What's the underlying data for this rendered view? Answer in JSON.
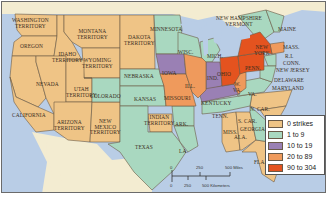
{
  "map": {
    "title": "Strikes by state",
    "colors": {
      "ocean": "#b9cde6",
      "mexico_canada": "#f3ecd1",
      "border": "#6b6b6b"
    },
    "legend": {
      "items": [
        {
          "label": "0 strikes",
          "color": "#efc486"
        },
        {
          "label": "1 to 9",
          "color": "#a9d8c0"
        },
        {
          "label": "10 to 19",
          "color": "#9a80b4"
        },
        {
          "label": "20 to 89",
          "color": "#ef9a5c"
        },
        {
          "label": "90 to 304",
          "color": "#e4531f"
        }
      ]
    },
    "scale": {
      "miles_ticks": [
        "0",
        "250",
        "500 Miles"
      ],
      "km_ticks": [
        "0",
        "250",
        "500 Kilometers"
      ]
    },
    "regions": [
      {
        "label": "WASHINGTON\nTERRITORY",
        "category": "0 strikes"
      },
      {
        "label": "OREGON",
        "category": "0 strikes"
      },
      {
        "label": "IDAHO\nTERRITORY",
        "category": "0 strikes"
      },
      {
        "label": "MONTANA\nTERRITORY",
        "category": "0 strikes"
      },
      {
        "label": "WYOMING\nTERRITORY",
        "category": "0 strikes"
      },
      {
        "label": "DAKOTA\nTERRITORY",
        "category": "0 strikes"
      },
      {
        "label": "NEVADA",
        "category": "0 strikes"
      },
      {
        "label": "UTAH\nTERRITORY",
        "category": "0 strikes"
      },
      {
        "label": "CALIFORNIA",
        "category": "0 strikes"
      },
      {
        "label": "ARIZONA\nTERRITORY",
        "category": "0 strikes"
      },
      {
        "label": "NEW\nMEXICO\nTERRITORY",
        "category": "0 strikes"
      },
      {
        "label": "COLORADO",
        "category": "1 to 9"
      },
      {
        "label": "NEBRASKA",
        "category": "1 to 9"
      },
      {
        "label": "KANSAS",
        "category": "1 to 9"
      },
      {
        "label": "INDIAN\nTERRITORY",
        "category": "0 strikes"
      },
      {
        "label": "TEXAS",
        "category": "1 to 9"
      },
      {
        "label": "MINNESOTA",
        "category": "1 to 9"
      },
      {
        "label": "IOWA",
        "category": "10 to 19"
      },
      {
        "label": "MISSOURI",
        "category": "20 to 89"
      },
      {
        "label": "ARK.",
        "category": "1 to 9"
      },
      {
        "label": "LA.",
        "category": "1 to 9"
      },
      {
        "label": "WISC.",
        "category": "1 to 9"
      },
      {
        "label": "ILL.",
        "category": "20 to 89"
      },
      {
        "label": "MICH.",
        "category": "1 to 9"
      },
      {
        "label": "IND.",
        "category": "10 to 19"
      },
      {
        "label": "OHIO",
        "category": "90 to 304"
      },
      {
        "label": "KENTUCKY",
        "category": "10 to 19"
      },
      {
        "label": "TENN.",
        "category": "1 to 9"
      },
      {
        "label": "MISS.",
        "category": "0 strikes"
      },
      {
        "label": "ALA.",
        "category": "0 strikes"
      },
      {
        "label": "GEORGIA",
        "category": "1 to 9"
      },
      {
        "label": "FLA.",
        "category": "0 strikes"
      },
      {
        "label": "N. CAR.",
        "category": "0 strikes"
      },
      {
        "label": "S. CAR.",
        "category": "0 strikes"
      },
      {
        "label": "VA.",
        "category": "1 to 9"
      },
      {
        "label": "W.\nVA.",
        "category": "20 to 89"
      },
      {
        "label": "PENN.",
        "category": "90 to 304"
      },
      {
        "label": "NEW\nYORK",
        "category": "90 to 304"
      },
      {
        "label": "NEW HAMPSHIRE\nVERMONT",
        "category": "1 to 9"
      },
      {
        "label": "MAINE",
        "category": "1 to 9"
      },
      {
        "label": "MASS.",
        "category": "20 to 89"
      },
      {
        "label": "R.I.",
        "category": "1 to 9"
      },
      {
        "label": "CONN.",
        "category": "1 to 9"
      },
      {
        "label": "NEW JERSEY",
        "category": "1 to 9"
      },
      {
        "label": "DELAWARE",
        "category": "1 to 9"
      },
      {
        "label": "MARYLAND",
        "category": "1 to 9"
      }
    ],
    "labels": {
      "washington": "WASHINGTON\nTERRITORY",
      "oregon": "OREGON",
      "idaho": "IDAHO\nTERRITORY",
      "montana": "MONTANA\nTERRITORY",
      "wyoming": "WYOMING\nTERRITORY",
      "dakota": "DAKOTA\nTERRITORY",
      "nevada": "NEVADA",
      "utah": "UTAH\nTERRITORY",
      "california": "CALIFORNIA",
      "arizona": "ARIZONA\nTERRITORY",
      "newmexico": "NEW\nMEXICO\nTERRITORY",
      "colorado": "COLORADO",
      "nebraska": "NEBRASKA",
      "kansas": "KANSAS",
      "indian": "INDIAN\nTERRITORY",
      "texas": "TEXAS",
      "minnesota": "MINNESOTA",
      "iowa": "IOWA",
      "missouri": "MISSOURI",
      "ark": "ARK.",
      "la": "LA.",
      "wisc": "WISC.",
      "ill": "ILL.",
      "mich": "MICH.",
      "ind": "IND.",
      "ohio": "OHIO",
      "kentucky": "KENTUCKY",
      "tenn": "TENN.",
      "miss": "MISS.",
      "ala": "ALA.",
      "georgia": "GEORGIA",
      "fla": "FLA.",
      "ncar": "N. CAR.",
      "scar": "S. CAR.",
      "va": "VA.",
      "wva": "W.\nVA.",
      "penn": "PENN.",
      "newyork": "NEW\nYORK",
      "nhvt": "NEW HAMPSHIRE\nVERMONT",
      "maine": "MAINE",
      "mass": "MASS.",
      "ri": "R.I.",
      "conn": "CONN.",
      "nj": "NEW JERSEY",
      "delaware": "DELAWARE",
      "maryland": "MARYLAND"
    }
  }
}
